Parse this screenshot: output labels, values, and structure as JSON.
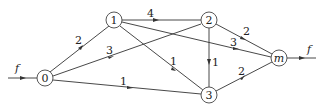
{
  "diagram": {
    "type": "flow-network",
    "nodes": [
      {
        "id": "0",
        "label": "0",
        "x": 45,
        "y": 78
      },
      {
        "id": "1",
        "label": "1",
        "x": 114,
        "y": 20
      },
      {
        "id": "2",
        "label": "2",
        "x": 209,
        "y": 20
      },
      {
        "id": "3",
        "label": "3",
        "x": 209,
        "y": 95
      },
      {
        "id": "m",
        "label": "m",
        "x": 279,
        "y": 58
      }
    ],
    "edges": [
      {
        "from": "0",
        "to": "1",
        "capacity": "2"
      },
      {
        "from": "0",
        "to": "2",
        "capacity": "3"
      },
      {
        "from": "0",
        "to": "3",
        "capacity": "1"
      },
      {
        "from": "1",
        "to": "2",
        "capacity": "4"
      },
      {
        "from": "1",
        "to": "3",
        "capacity": "1"
      },
      {
        "from": "1",
        "to": "m",
        "capacity": "3"
      },
      {
        "from": "2",
        "to": "3",
        "capacity": "1"
      },
      {
        "from": "2",
        "to": "m",
        "capacity": "2"
      },
      {
        "from": "3",
        "to": "m",
        "capacity": "2"
      }
    ],
    "source_flow_label": "f",
    "sink_flow_label": "f"
  }
}
